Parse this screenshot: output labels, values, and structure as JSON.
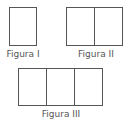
{
  "figures": [
    {
      "label": "Figura I",
      "cells": 1
    },
    {
      "label": "Figura II",
      "cells": 2
    },
    {
      "label": "Figura III",
      "cells": 3
    }
  ],
  "colors": {
    "stroke": "#555555",
    "text": "#555555",
    "background": "#ffffff"
  }
}
